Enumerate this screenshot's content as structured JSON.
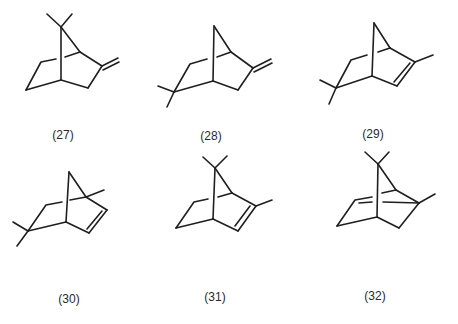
{
  "figure": {
    "compounds": [
      {
        "id": "27",
        "label": "(27)",
        "x": 63,
        "y": 136
      },
      {
        "id": "28",
        "label": "(28)",
        "x": 211,
        "y": 137
      },
      {
        "id": "29",
        "label": "(29)",
        "x": 373,
        "y": 135
      },
      {
        "id": "30",
        "label": "(30)",
        "x": 69,
        "y": 290
      },
      {
        "id": "31",
        "label": "(31)",
        "x": 215,
        "y": 288
      },
      {
        "id": "32",
        "label": "(32)",
        "x": 375,
        "y": 287
      }
    ],
    "stroke_color": "#1f1f1f"
  }
}
